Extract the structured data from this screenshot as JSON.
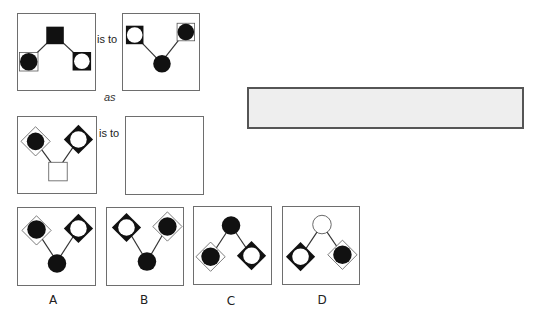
{
  "puzzle": {
    "relation_label": "is to",
    "connector_label": "as",
    "colors": {
      "fill_dark": "#111111",
      "fill_light": "#ffffff",
      "line": "#333333",
      "answer_box_fill": "#eeeeee"
    }
  },
  "panels": {
    "source": {
      "elements": [
        {
          "shape": "square",
          "fill": "black",
          "position": "top-center"
        },
        {
          "shape": "outlined-square-with-black-circle",
          "position": "bottom-left"
        },
        {
          "shape": "black-square-with-white-circle",
          "position": "bottom-right"
        }
      ]
    },
    "source_result": {
      "elements": [
        {
          "shape": "black-square-with-white-circle",
          "position": "top-left"
        },
        {
          "shape": "outlined-square-with-black-circle",
          "position": "top-right"
        },
        {
          "shape": "circle",
          "fill": "black",
          "position": "bottom-center"
        }
      ]
    },
    "target": {
      "elements": [
        {
          "shape": "outlined-diamond-with-black-circle",
          "position": "top-left"
        },
        {
          "shape": "black-diamond-with-white-circle",
          "position": "top-right"
        },
        {
          "shape": "square",
          "fill": "white",
          "position": "bottom-center"
        }
      ]
    },
    "target_result": {
      "elements": []
    }
  },
  "options": [
    {
      "label": "A",
      "elements": [
        "outlined-diamond-with-black-circle top-left",
        "black-diamond-with-white-circle top-right",
        "black circle bottom-center"
      ]
    },
    {
      "label": "B",
      "elements": [
        "black-diamond-with-white-circle top-left",
        "outlined-diamond-with-black-circle top-right",
        "black circle bottom-center"
      ]
    },
    {
      "label": "C",
      "elements": [
        "black circle top-center",
        "outlined-diamond-with-black-circle bottom-left",
        "black-diamond-with-white-circle bottom-right"
      ]
    },
    {
      "label": "D",
      "elements": [
        "white circle top-center",
        "black-diamond-with-white-circle bottom-left",
        "outlined-diamond-with-black-circle bottom-right"
      ]
    }
  ],
  "answer_box": {
    "value": ""
  }
}
